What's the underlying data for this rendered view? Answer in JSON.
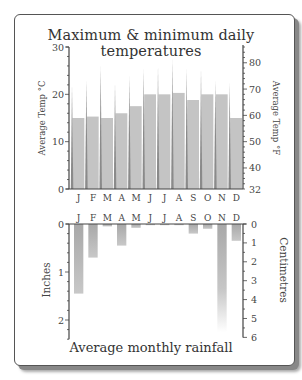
{
  "chart_data": [
    {
      "type": "bar",
      "title": "Maximum & minimum daily temperatures",
      "categories": [
        "J",
        "F",
        "M",
        "A",
        "M",
        "J",
        "J",
        "A",
        "S",
        "O",
        "N",
        "D"
      ],
      "series": [
        {
          "name": "Average temperature (°C)",
          "values": [
            15,
            15.3,
            15,
            16,
            17.5,
            20,
            20,
            20.3,
            18.8,
            20,
            20,
            15
          ]
        },
        {
          "name": "Maximum temperature spike (°C)",
          "values": [
            22,
            23,
            26,
            22.5,
            24,
            25.5,
            26,
            27.5,
            25.5,
            25.5,
            23,
            22.5
          ]
        }
      ],
      "ylabel": "Average Temp °C",
      "ylabel_right": "Average Temp °F",
      "ylim": [
        0,
        30
      ],
      "yticks": [
        0,
        10,
        20,
        30
      ],
      "yticks_right": [
        32,
        40,
        50,
        60,
        70,
        80
      ],
      "grid": false
    },
    {
      "type": "bar",
      "title": "Average monthly rainfall",
      "categories": [
        "J",
        "F",
        "M",
        "A",
        "M",
        "J",
        "J",
        "A",
        "S",
        "O",
        "N",
        "D"
      ],
      "series": [
        {
          "name": "Rainfall (inches)",
          "values": [
            1.45,
            0.7,
            0.05,
            0.45,
            0.08,
            0.02,
            0.02,
            0.02,
            0.2,
            0.1,
            2.25,
            0.35
          ]
        }
      ],
      "ylabel": "Inches",
      "ylabel_right": "Centimetres",
      "ylim": [
        0,
        2.4
      ],
      "yticks": [
        0,
        1,
        2
      ],
      "yticks_right": [
        0,
        1,
        2,
        3,
        4,
        5,
        6
      ],
      "orientation": "downward",
      "grid": false
    }
  ],
  "labels": {
    "title": "Maximum & minimum daily temperatures",
    "subtitle": "Average monthly rainfall",
    "temp_c_axis": "Average Temp °C",
    "temp_f_axis": "Average Temp °F",
    "rain_in_axis": "Inches",
    "rain_cm_axis": "Centimetres"
  },
  "colors": {
    "bar": "#c4c4c4",
    "spike": "#8a8a8a",
    "rain_bar": "#a9a9a9",
    "axis": "#444444"
  }
}
